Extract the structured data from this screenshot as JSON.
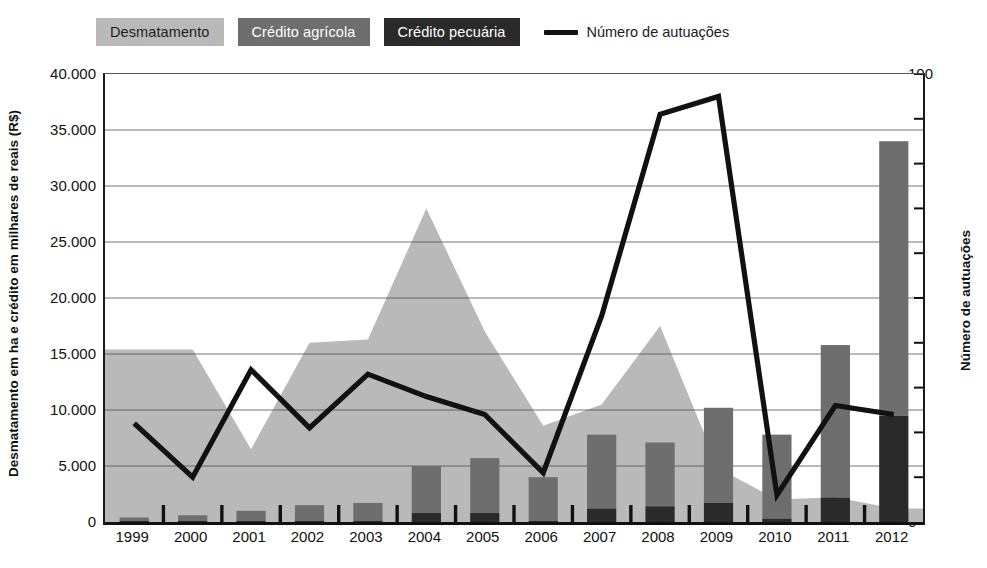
{
  "legend": {
    "items": [
      {
        "label": "Desmatamento",
        "color": "#b9b9b9",
        "type": "area-swatch"
      },
      {
        "label": "Crédito agrícola",
        "color": "#6e6e6e",
        "type": "bar-swatch"
      },
      {
        "label": "Crédito pecuária",
        "color": "#2a2a2a",
        "type": "bar-swatch"
      }
    ],
    "line_item": {
      "label": "Número de autuações",
      "color": "#111111",
      "type": "line-swatch"
    }
  },
  "axes": {
    "left_title": "Desmatamento em ha e crédito em milhares de reais (R$)",
    "right_title": "Número de autuações",
    "left_ticks": [
      "0",
      "5.000",
      "10.000",
      "15.000",
      "20.000",
      "25.000",
      "30.000",
      "35.000",
      "40.000"
    ],
    "right_ticks": [
      "0",
      "10",
      "20",
      "30",
      "40",
      "50",
      "60",
      "70",
      "80",
      "90",
      "100"
    ]
  },
  "chart_data": {
    "type": "bar",
    "title": "",
    "xlabel": "",
    "ylabel": "Desmatamento em ha e crédito em milhares de reais (R$)",
    "y2label": "Número de autuações",
    "ylim": [
      0,
      40000
    ],
    "y2lim": [
      0,
      100
    ],
    "grid": true,
    "legend_position": "top-left",
    "categories": [
      "1999",
      "2000",
      "2001",
      "2002",
      "2003",
      "2004",
      "2005",
      "2006",
      "2007",
      "2008",
      "2009",
      "2010",
      "2011",
      "2012"
    ],
    "series": [
      {
        "name": "Desmatamento",
        "type": "area",
        "color": "#b9b9b9",
        "axis": "left",
        "values": [
          15400,
          15400,
          6500,
          16000,
          16300,
          28000,
          17000,
          8600,
          10500,
          17500,
          4800,
          2000,
          2200,
          1200
        ]
      },
      {
        "name": "Crédito agrícola",
        "type": "bar-stack",
        "color": "#6e6e6e",
        "axis": "left",
        "values": [
          300,
          500,
          900,
          1400,
          1600,
          4200,
          4900,
          3900,
          6600,
          5700,
          8500,
          7500,
          13600,
          24500
        ]
      },
      {
        "name": "Crédito pecuária",
        "type": "bar-stack",
        "color": "#2a2a2a",
        "axis": "left",
        "values": [
          100,
          100,
          100,
          100,
          100,
          800,
          800,
          100,
          1200,
          1400,
          1700,
          300,
          2200,
          9500
        ]
      },
      {
        "name": "Número de autuações",
        "type": "line",
        "color": "#111111",
        "axis": "right",
        "values": [
          22,
          10,
          34,
          21,
          33,
          28,
          24,
          11,
          46,
          91,
          95,
          6,
          26,
          24
        ]
      }
    ]
  }
}
